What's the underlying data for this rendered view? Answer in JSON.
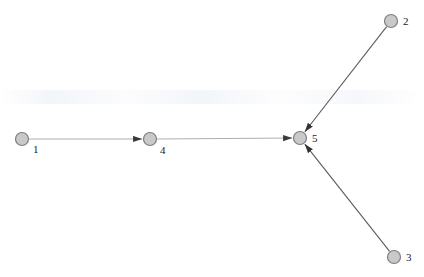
{
  "canvas": {
    "width": 424,
    "height": 277,
    "background": "#ffffff"
  },
  "style": {
    "node_fill": "#c9c9c9",
    "node_stroke": "#7f7f7f",
    "node_radius": 6.5,
    "node_stroke_width": 1.2,
    "label_color": "#1a1a1a",
    "light_edge_color": "#aeaeae",
    "dark_edge_color": "#5a5a5a",
    "edge_width": 1.1,
    "arrow_color": "#3a3a3a"
  },
  "graph": {
    "type": "directed-graph",
    "node_count": 5,
    "edge_count": 4,
    "nodes": [
      {
        "id": "1",
        "label": "1",
        "x": 22,
        "y": 139,
        "label_x": 33,
        "label_y": 150
      },
      {
        "id": "2",
        "label": "2",
        "x": 391,
        "y": 21,
        "label_x": 403,
        "label_y": 22
      },
      {
        "id": "3",
        "label": "3",
        "x": 394,
        "y": 257,
        "label_x": 406,
        "label_y": 258
      },
      {
        "id": "4",
        "label": "4",
        "x": 150,
        "y": 139,
        "label_x": 160,
        "label_y": 151
      },
      {
        "id": "5",
        "label": "5",
        "x": 300,
        "y": 138,
        "label_x": 312,
        "label_y": 139
      }
    ],
    "edges": [
      {
        "id": "e1",
        "source": "1",
        "target": "4",
        "directed": true,
        "tone": "light"
      },
      {
        "id": "e2",
        "source": "4",
        "target": "5",
        "directed": true,
        "tone": "light"
      },
      {
        "id": "e3",
        "source": "2",
        "target": "5",
        "directed": true,
        "tone": "dark"
      },
      {
        "id": "e4",
        "source": "3",
        "target": "5",
        "directed": true,
        "tone": "dark"
      }
    ]
  }
}
